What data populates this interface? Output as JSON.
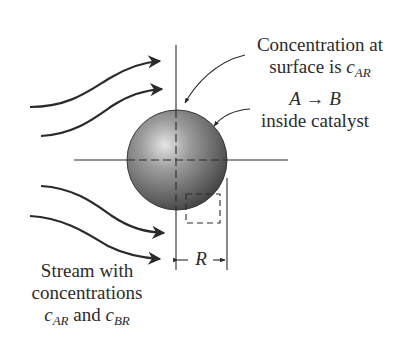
{
  "labels": {
    "surface": {
      "line1": "Concentration at",
      "line2_prefix": "surface is ",
      "var": "c",
      "sub": "AR"
    },
    "reaction": {
      "lhs": "A",
      "arrow": "→",
      "rhs": "B",
      "line2": "inside catalyst"
    },
    "stream": {
      "line1": "Stream with",
      "line2": "concentrations",
      "var1": "c",
      "sub1": "AR",
      "and": " and ",
      "var2": "c",
      "sub2": "BR"
    },
    "radius": "R"
  },
  "colors": {
    "line": "#2a2a2a",
    "sphere_light": "#d6d6d6",
    "sphere_mid": "#8a8a8a",
    "sphere_dark": "#4a4a4a"
  }
}
